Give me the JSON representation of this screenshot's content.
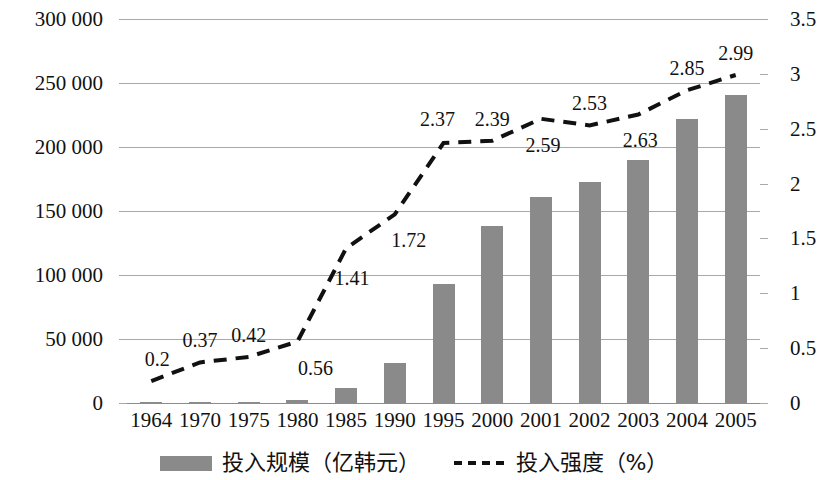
{
  "chart_data": {
    "type": "bar",
    "title": "",
    "subtitle": "",
    "xlabel": "",
    "ylabel": "",
    "y2label": "",
    "grid": true,
    "legend_position": "bottom",
    "categories": [
      "1964",
      "1970",
      "1975",
      "1980",
      "1985",
      "1990",
      "1995",
      "2000",
      "2001",
      "2002",
      "2003",
      "2004",
      "2005"
    ],
    "ylim": [
      0,
      300000
    ],
    "yticks": [
      "0",
      "50 000",
      "100 000",
      "150 000",
      "200 000",
      "250 000",
      "300 000"
    ],
    "ytick_values": [
      0,
      50000,
      100000,
      150000,
      200000,
      250000,
      300000
    ],
    "y2lim": [
      0,
      3.5
    ],
    "y2ticks": [
      "0",
      "0.5",
      "1",
      "1.5",
      "2",
      "2.5",
      "3",
      "3.5"
    ],
    "y2tick_values": [
      0,
      0.5,
      1,
      1.5,
      2,
      2.5,
      3,
      3.5
    ],
    "series": [
      {
        "name": "投入规模（亿韩元）",
        "type": "bar",
        "axis": "left",
        "color": "#8a8a8a",
        "values": [
          300,
          1000,
          900,
          2300,
          12000,
          31000,
          93000,
          138000,
          161000,
          173000,
          190000,
          222000,
          241000
        ]
      },
      {
        "name": "投入强度（%）",
        "type": "line",
        "axis": "right",
        "color": "#111111",
        "style": "dashed",
        "values": [
          0.2,
          0.37,
          0.42,
          0.56,
          1.41,
          1.72,
          2.37,
          2.39,
          2.59,
          2.53,
          2.63,
          2.85,
          2.99
        ],
        "data_labels": [
          "0.2",
          "0.37",
          "0.42",
          "0.56",
          "1.41",
          "1.72",
          "2.37",
          "2.39",
          "2.59",
          "2.53",
          "2.63",
          "2.85",
          "2.99"
        ],
        "data_label_positions": [
          "above",
          "above",
          "above",
          "below",
          "below",
          "below",
          "above",
          "above",
          "below",
          "above",
          "below",
          "above",
          "above"
        ]
      }
    ]
  },
  "legend": {
    "entries": [
      {
        "label": "投入规模（亿韩元）",
        "marker": "bar-swatch"
      },
      {
        "label": "投入强度（%）",
        "marker": "dashed-line-swatch"
      }
    ]
  }
}
